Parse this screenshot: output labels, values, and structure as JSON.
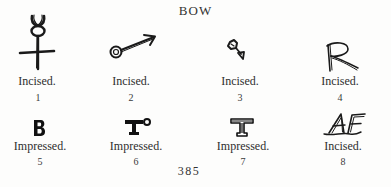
{
  "page": {
    "title": "BOW",
    "page_number": "385"
  },
  "marks": [
    {
      "number": "1",
      "type": "Incised.",
      "glyph": "horned-cross-icon"
    },
    {
      "number": "2",
      "type": "Incised.",
      "glyph": "circle-arrow-icon"
    },
    {
      "number": "3",
      "type": "Incised.",
      "glyph": "knotted-arrow-icon"
    },
    {
      "number": "4",
      "type": "Incised.",
      "glyph": "letter-r-icon"
    },
    {
      "number": "5",
      "type": "Impressed.",
      "glyph": "letter-b-icon"
    },
    {
      "number": "6",
      "type": "Impressed.",
      "glyph": "letter-t-with-circle-icon"
    },
    {
      "number": "7",
      "type": "Impressed.",
      "glyph": "letter-t-icon"
    },
    {
      "number": "8",
      "type": "Incised.",
      "glyph": "monogram-af-icon"
    }
  ],
  "colors": {
    "ink": "#1a1a1a",
    "paper": "#fdfdfc"
  }
}
